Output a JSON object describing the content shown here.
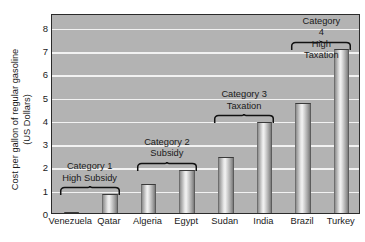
{
  "chart_data": {
    "type": "bar",
    "title": "",
    "subtitle": "",
    "xlabel": "",
    "ylabel": "Cost per gallon of regular gasoline\n(US Dollars)",
    "categories": [
      "Venezuela",
      "Qatar",
      "Algeria",
      "Egypt",
      "Sudan",
      "India",
      "Brazil",
      "Turkey"
    ],
    "values": [
      0.05,
      0.8,
      1.25,
      1.85,
      2.4,
      3.9,
      4.75,
      7.05
    ],
    "ylim": [
      0,
      8.6
    ],
    "yticks": [
      0,
      1,
      2,
      3,
      4,
      5,
      6,
      7,
      8
    ],
    "ytick_labels": [
      "0",
      "1",
      "2",
      "3",
      "4",
      "5",
      "6",
      "7",
      "8"
    ],
    "grid": true,
    "grid_axis": "y",
    "legend": "none",
    "plot_background": "#b3b3b3",
    "gridline_color": "#f2f2f2",
    "bar_color": "#c8c8c8",
    "frame_color": "#2b2b2b",
    "annotations": [
      {
        "label": "Category 1\nHigh Subsidy",
        "countries": [
          "Venezuela",
          "Qatar"
        ],
        "bracket_from": "Venezuela",
        "bracket_to": "Qatar"
      },
      {
        "label": "Category 2\nSubsidy",
        "countries": [
          "Algeria",
          "Egypt"
        ],
        "bracket_from": "Algeria",
        "bracket_to": "Egypt"
      },
      {
        "label": "Category 3\nTaxation",
        "countries": [
          "Sudan",
          "India"
        ],
        "bracket_from": "Sudan",
        "bracket_to": "India"
      },
      {
        "label": "Category 4\nHigh Taxation",
        "countries": [
          "Brazil",
          "Turkey"
        ],
        "bracket_from": "Brazil",
        "bracket_to": "Turkey"
      }
    ]
  }
}
